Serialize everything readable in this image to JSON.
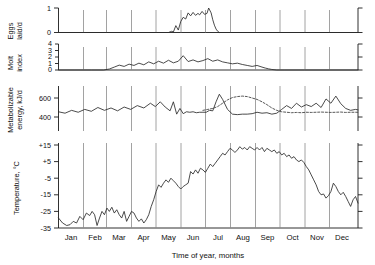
{
  "figure": {
    "xaxis_title": "Time of year, months",
    "month_labels": [
      "Jan",
      "Feb",
      "Mar",
      "Apr",
      "May",
      "Jun",
      "Jul",
      "Aug",
      "Sep",
      "Oct",
      "Nov",
      "Dec"
    ]
  },
  "panels": {
    "eggs": {
      "ylabel_line1": "Eggs",
      "ylabel_line2": "laid/d",
      "tick_labels": [
        "1",
        "0"
      ]
    },
    "molt": {
      "ylabel_line1": "Molt",
      "ylabel_line2": "index",
      "tick_labels": [
        "4",
        "3",
        "2",
        "1",
        "0"
      ]
    },
    "energy": {
      "ylabel_line1": "Metabolizable",
      "ylabel_line2": "energy, kJ/d",
      "tick_labels": [
        "600",
        "400"
      ]
    },
    "temperature": {
      "ylabel_line1": "Temperature, °C",
      "tick_labels": [
        "+15",
        "+5",
        "-5",
        "-15",
        "-25",
        "-35"
      ]
    }
  },
  "chart_data": {
    "type": "line",
    "title": "",
    "xlabel": "Time of year, months",
    "subplot_count": 4,
    "grid": true,
    "gridlines_at": [
      "Jan",
      "Feb",
      "Mar",
      "Apr",
      "May",
      "Jun",
      "Jul",
      "Aug",
      "Sep",
      "Oct",
      "Nov",
      "Dec"
    ],
    "legend": "none",
    "x": {
      "label": "Time of year, months",
      "ticks": [
        "Jan",
        "Feb",
        "Mar",
        "Apr",
        "May",
        "Jun",
        "Jul",
        "Aug",
        "Sep",
        "Oct",
        "Nov",
        "Dec"
      ],
      "range_days": [
        0,
        365
      ]
    },
    "subplots": [
      {
        "index": 0,
        "ylabel": "Eggs laid/d",
        "ylim": [
          0,
          1
        ],
        "yticks": [
          0,
          1
        ],
        "series": [
          {
            "name": "Eggs laid per day",
            "style": "solid",
            "x_days": [
              0,
              20,
              40,
              60,
              80,
              100,
              115,
              125,
              130,
              134,
              138,
              140,
              143,
              146,
              149,
              152,
              155,
              158,
              161,
              164,
              167,
              170,
              172,
              175,
              178,
              181,
              183,
              186,
              188,
              190,
              192,
              194,
              196,
              200,
              210,
              230,
              260,
              300,
              340,
              365
            ],
            "values": [
              0,
              0,
              0,
              0,
              0,
              0,
              0,
              0,
              0,
              0,
              0.05,
              0.02,
              0.28,
              0.1,
              0.45,
              0.62,
              0.55,
              0.8,
              0.68,
              0.82,
              0.7,
              0.78,
              0.72,
              0.86,
              0.74,
              0.78,
              1.0,
              0.8,
              0.52,
              0.3,
              0.14,
              0.05,
              0,
              0,
              0,
              0,
              0,
              0,
              0,
              0
            ]
          }
        ]
      },
      {
        "index": 1,
        "ylabel": "Molt index",
        "ylim": [
          0,
          4
        ],
        "yticks": [
          0,
          1,
          2,
          3,
          4
        ],
        "series": [
          {
            "name": "Molt index",
            "style": "solid",
            "x_days": [
              0,
              20,
              40,
              55,
              62,
              68,
              74,
              80,
              86,
              92,
              98,
              104,
              110,
              116,
              122,
              128,
              134,
              140,
              146,
              152,
              158,
              164,
              170,
              176,
              182,
              188,
              194,
              200,
              206,
              212,
              218,
              224,
              230,
              236,
              242,
              248,
              252,
              256,
              260,
              266,
              275,
              300,
              330,
              365
            ],
            "values": [
              0,
              0,
              0,
              0,
              0.15,
              0.45,
              0.75,
              0.55,
              0.9,
              0.7,
              1.05,
              0.8,
              1.25,
              0.95,
              1.35,
              1.05,
              1.5,
              1.1,
              1.35,
              2.2,
              1.3,
              1.55,
              1.25,
              1.45,
              1.75,
              1.35,
              1.55,
              1.25,
              1.1,
              0.95,
              1.05,
              0.85,
              0.7,
              0.55,
              0.7,
              0.45,
              0.3,
              0.18,
              0.08,
              0,
              0,
              0,
              0,
              0
            ]
          }
        ]
      },
      {
        "index": 2,
        "ylabel": "Metabolizable energy, kJ/d",
        "ylim": [
          320,
          700
        ],
        "yticks": [
          400,
          600
        ],
        "series": [
          {
            "name": "Metabolizable energy (measured)",
            "style": "solid",
            "x_days": [
              0,
              8,
              16,
              24,
              32,
              40,
              48,
              56,
              64,
              72,
              80,
              88,
              96,
              104,
              112,
              118,
              124,
              130,
              136,
              140,
              144,
              148,
              152,
              156,
              160,
              164,
              168,
              172,
              176,
              180,
              184,
              188,
              192,
              196,
              200,
              206,
              212,
              218,
              224,
              230,
              236,
              242,
              248,
              254,
              260,
              266,
              272,
              278,
              284,
              290,
              296,
              302,
              308,
              314,
              320,
              326,
              332,
              338,
              344,
              350,
              356,
              362,
              365
            ],
            "values": [
              455,
              440,
              470,
              450,
              480,
              460,
              500,
              470,
              495,
              465,
              505,
              480,
              520,
              495,
              545,
              510,
              560,
              505,
              465,
              560,
              430,
              490,
              435,
              455,
              450,
              455,
              445,
              450,
              450,
              450,
              470,
              465,
              560,
              640,
              585,
              480,
              430,
              425,
              430,
              430,
              435,
              450,
              440,
              445,
              430,
              440,
              480,
              520,
              490,
              545,
              505,
              530,
              510,
              545,
              500,
              590,
              545,
              620,
              540,
              490,
              470,
              480,
              475
            ]
          },
          {
            "name": "Metabolizable energy (estimated)",
            "style": "dotted",
            "x_days": [
              176,
              182,
              188,
              194,
              200,
              206,
              212,
              218,
              224,
              230,
              236,
              242,
              248,
              254,
              260,
              266,
              272,
              278,
              284,
              290,
              296,
              302,
              308,
              314,
              320,
              326,
              332,
              338,
              344,
              350,
              356,
              362,
              365
            ],
            "values": [
              470,
              480,
              490,
              510,
              545,
              580,
              605,
              615,
              620,
              615,
              600,
              585,
              560,
              530,
              495,
              470,
              455,
              450,
              445,
              448,
              445,
              450,
              448,
              450,
              452,
              450,
              448,
              450,
              452,
              448,
              450,
              450,
              450
            ]
          }
        ]
      },
      {
        "index": 3,
        "ylabel": "Temperature, °C",
        "ylim": [
          -35,
          15
        ],
        "yticks": [
          15,
          5,
          -5,
          -15,
          -25,
          -35
        ],
        "units": "°C",
        "series": [
          {
            "name": "Air temperature",
            "style": "solid",
            "x_days": [
              0,
              5,
              10,
              14,
              18,
              22,
              26,
              30,
              34,
              38,
              41,
              44,
              47,
              50,
              53,
              56,
              59,
              62,
              65,
              68,
              71,
              74,
              77,
              80,
              83,
              86,
              89,
              92,
              95,
              98,
              101,
              104,
              107,
              110,
              113,
              116,
              119,
              122,
              125,
              128,
              131,
              134,
              137,
              140,
              143,
              146,
              149,
              152,
              155,
              158,
              161,
              164,
              167,
              170,
              173,
              176,
              179,
              182,
              185,
              188,
              191,
              194,
              197,
              200,
              203,
              206,
              209,
              212,
              215,
              218,
              221,
              224,
              227,
              230,
              233,
              236,
              239,
              242,
              245,
              248,
              251,
              254,
              257,
              260,
              263,
              266,
              269,
              272,
              275,
              278,
              281,
              284,
              287,
              290,
              293,
              296,
              299,
              302,
              305,
              308,
              311,
              314,
              317,
              320,
              323,
              326,
              329,
              332,
              335,
              338,
              341,
              344,
              347,
              350,
              353,
              356,
              359,
              362,
              365
            ],
            "values": [
              -29,
              -32,
              -33.5,
              -33,
              -31,
              -32,
              -28,
              -30,
              -26,
              -27.5,
              -25,
              -27,
              -33.5,
              -29,
              -25,
              -27,
              -23,
              -25,
              -22.5,
              -26,
              -24,
              -27,
              -29,
              -25,
              -31,
              -28,
              -25,
              -26,
              -29,
              -31,
              -29.5,
              -32,
              -30,
              -27,
              -22,
              -18,
              -13,
              -9,
              -10.5,
              -8,
              -6,
              -7.5,
              -5,
              -6.5,
              -8,
              -10,
              -11.5,
              -10,
              -9,
              -8,
              -1,
              -2.5,
              0,
              -2,
              1,
              0,
              -1.5,
              1,
              3.5,
              2,
              4,
              6,
              8,
              10,
              9,
              11,
              13,
              12,
              10.5,
              12,
              14,
              12.5,
              13.5,
              12,
              14,
              13,
              12,
              13.5,
              12,
              13.5,
              11,
              13,
              12,
              11,
              12,
              10,
              11,
              9,
              10,
              8,
              9,
              7,
              8,
              6,
              5,
              6,
              4.5,
              2,
              0,
              -3,
              -6,
              -9,
              -13,
              -15,
              -14.5,
              -17,
              -15.5,
              -13,
              -8,
              -10,
              -13,
              -15,
              -13.5,
              -16,
              -19,
              -22,
              -18,
              -16,
              -20,
              -24,
              -28,
              -33,
              -35
            ]
          }
        ]
      }
    ]
  }
}
